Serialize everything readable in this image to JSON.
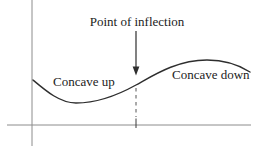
{
  "figure": {
    "annotation": "Point of inflection",
    "curve_labels": {
      "left": "Concave up",
      "right": "Concave down"
    },
    "colors": {
      "background": "#ffffff",
      "curve": "#2e2e2e",
      "axis": "#8c8c8c",
      "text": "#1c1c1c",
      "dashed_guide": "#555555"
    },
    "geometry": {
      "curve_path": "M 33 80 C 46 91 60 103 76 103 C 99 103 118 95 136 85 C 154 75 177 60 207 60 C 226 60 239 65 250 72",
      "inflection_x": 136
    }
  }
}
